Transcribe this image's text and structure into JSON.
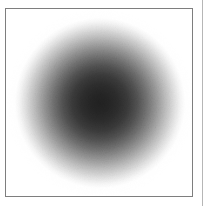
{
  "figure": {
    "caption": "",
    "frame": {
      "border_color": "#7e7e7e",
      "border_width_px": 1,
      "left_px": 5,
      "top_px": 8,
      "width_px": 188,
      "height_px": 189,
      "background_color": "#ffffff"
    },
    "page_edge_rule": {
      "color": "#b6b6b6",
      "x_px": 202,
      "width_px": 1
    }
  },
  "chart_data": {
    "type": "heatmap",
    "title": "",
    "subtitle": "",
    "xlabel": "",
    "ylabel": "",
    "legend": [],
    "grid": false,
    "annotations": [],
    "colormap": "grayscale",
    "colormap_min_color": "#ffffff",
    "colormap_max_color": "#1f1f1f",
    "center_x_px": 95,
    "center_y_px": 95,
    "radius_px": 86,
    "noise": {
      "present": true,
      "grain_size_px": 1,
      "amplitude": 0.12
    },
    "radial_profile": {
      "xlabel": "radius (px from center)",
      "ylabel": "gray level (0=black, 255=white)",
      "x": [
        0,
        10,
        20,
        30,
        40,
        50,
        60,
        70,
        80,
        86,
        95
      ],
      "values": [
        34,
        38,
        46,
        60,
        84,
        116,
        152,
        190,
        226,
        246,
        255
      ],
      "xlim": [
        0,
        95
      ],
      "ylim": [
        0,
        255
      ]
    },
    "gradient_stops": [
      {
        "offset_pct": 0,
        "color": "#222222"
      },
      {
        "offset_pct": 11,
        "color": "#262626"
      },
      {
        "offset_pct": 22,
        "color": "#2e2e2e"
      },
      {
        "offset_pct": 33,
        "color": "#3c3c3c"
      },
      {
        "offset_pct": 44,
        "color": "#545454"
      },
      {
        "offset_pct": 55,
        "color": "#747474"
      },
      {
        "offset_pct": 66,
        "color": "#989898"
      },
      {
        "offset_pct": 77,
        "color": "#bebebe"
      },
      {
        "offset_pct": 88,
        "color": "#e2e2e2"
      },
      {
        "offset_pct": 95,
        "color": "#f6f6f6"
      },
      {
        "offset_pct": 100,
        "color": "#ffffff"
      }
    ]
  }
}
